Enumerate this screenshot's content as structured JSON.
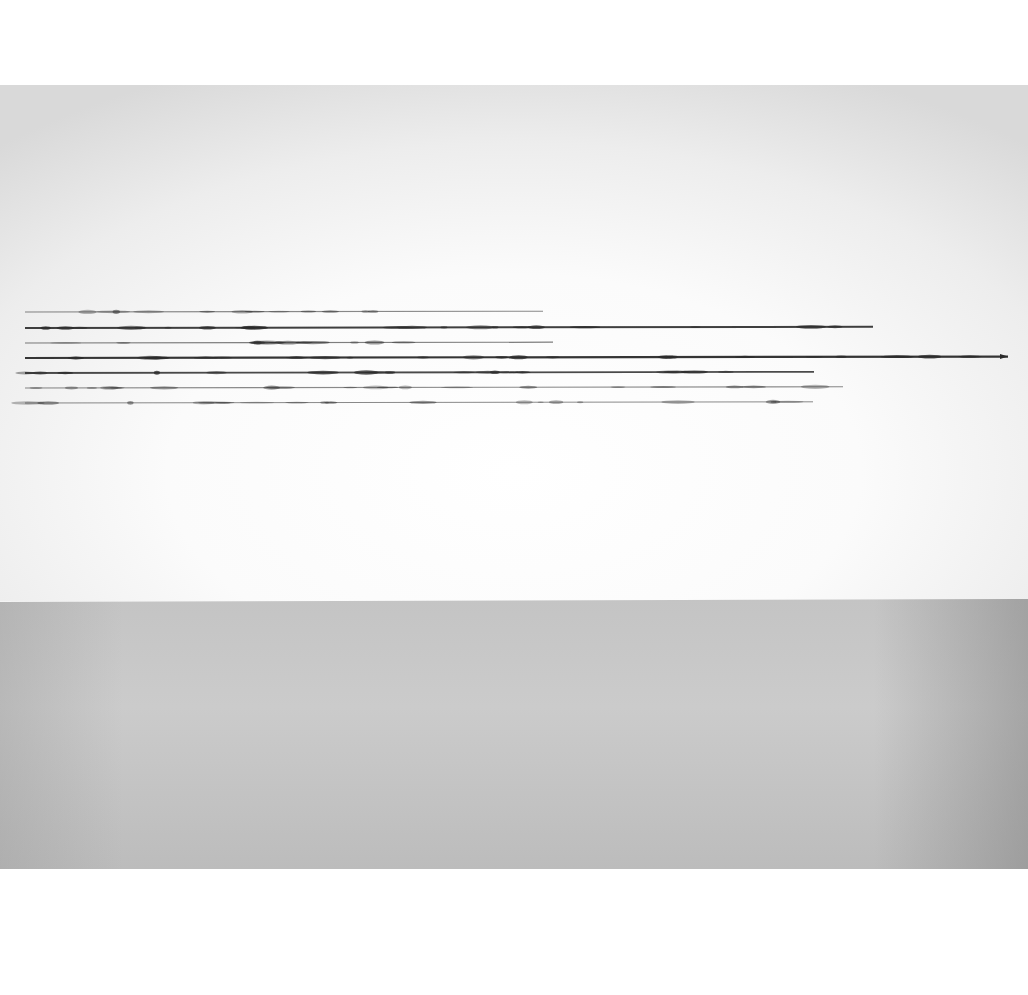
{
  "scene": {
    "subject": "artwork photograph: seven horizontal hand-drawn lines on a white gallery wall above a grey floor",
    "colors": {
      "margin": "#ffffff",
      "wall": "#fafafa",
      "wall_corner": "#d9d9d9",
      "floor": "#c6c6c6",
      "ink": "#2a2a2a"
    }
  },
  "lines": [
    {
      "y": 312,
      "x1": 25,
      "x2": 543,
      "weight": 1.1,
      "opacity": 0.55
    },
    {
      "y": 328,
      "x1": 25,
      "x2": 873,
      "weight": 2.0,
      "opacity": 0.9
    },
    {
      "y": 343,
      "x1": 25,
      "x2": 553,
      "weight": 1.2,
      "opacity": 0.6
    },
    {
      "y": 358,
      "x1": 25,
      "x2": 1008,
      "weight": 2.2,
      "opacity": 0.95,
      "arrow": true
    },
    {
      "y": 373,
      "x1": 25,
      "x2": 814,
      "weight": 1.8,
      "opacity": 0.85
    },
    {
      "y": 388,
      "x1": 25,
      "x2": 843,
      "weight": 1.1,
      "opacity": 0.55
    },
    {
      "y": 403,
      "x1": 25,
      "x2": 813,
      "weight": 1.0,
      "opacity": 0.55
    }
  ]
}
